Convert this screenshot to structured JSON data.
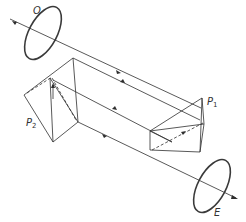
{
  "diagram": {
    "labels": {
      "objective": "O",
      "eyepiece": "E",
      "prism_1": "P",
      "prism_1_sub": "1",
      "prism_2": "P",
      "prism_2_sub": "2"
    },
    "colors": {
      "line": "#2e2e2e",
      "ring": "#3a3a3a",
      "background": "#ffffff"
    }
  }
}
